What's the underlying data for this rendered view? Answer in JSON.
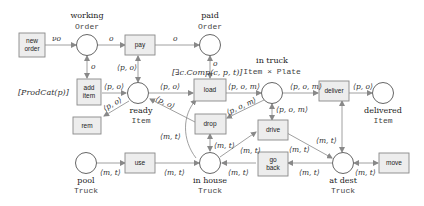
{
  "diagram": {
    "type": "colored-petri-net",
    "places": [
      {
        "id": "working",
        "name": "working",
        "type": "Order"
      },
      {
        "id": "paid",
        "name": "paid",
        "type": "Order"
      },
      {
        "id": "ready",
        "name": "ready",
        "type": "Item"
      },
      {
        "id": "intruck",
        "name": "in truck",
        "type": "Item × Plate"
      },
      {
        "id": "delivered",
        "name": "delivered",
        "type": "Item"
      },
      {
        "id": "pool",
        "name": "pool",
        "type": "Truck"
      },
      {
        "id": "inhouse",
        "name": "in house",
        "type": "Truck"
      },
      {
        "id": "atdest",
        "name": "at dest",
        "type": "Truck"
      }
    ],
    "transitions": [
      {
        "id": "neworder",
        "label_line1": "new",
        "label_line2": "order"
      },
      {
        "id": "pay",
        "label": "pay"
      },
      {
        "id": "additem",
        "label_line1": "add",
        "label_line2": "item"
      },
      {
        "id": "rem",
        "label": "rem"
      },
      {
        "id": "load",
        "label": "load"
      },
      {
        "id": "drop",
        "label": "drop"
      },
      {
        "id": "deliver",
        "label": "deliver"
      },
      {
        "id": "drive",
        "label": "drive"
      },
      {
        "id": "goback",
        "label_line1": "go",
        "label_line2": "back"
      },
      {
        "id": "use",
        "label": "use"
      },
      {
        "id": "move",
        "label": "move"
      }
    ],
    "guards": {
      "additem": "[ProdCat(p)]",
      "load": "[∃c.Comp(c, p, t)]"
    },
    "arc_labels": {
      "neworder_working": "νo",
      "working_pay": "o",
      "pay_paid": "o",
      "working_additem": "o",
      "paid_load": "o",
      "additem_ready": "⟨p, o⟩",
      "ready_pay": "⟨p, o⟩",
      "ready_load": "⟨p, o⟩",
      "ready_rem": "⟨p, o⟩",
      "drop_ready": "⟨p, o⟩",
      "load_intruck": "⟨p, o, m⟩",
      "intruck_deliver": "⟨p, o, m⟩",
      "deliver_delivered": "⟨p, o⟩",
      "intruck_drop": "⟨p, o, m⟩",
      "intruck_drive": "⟨p, o, m⟩",
      "inhouse_load": "⟨m, t⟩",
      "drop_inhouse": "⟨m, t⟩",
      "inhouse_drive": "⟨m, t⟩",
      "drive_atdest": "⟨m, t⟩",
      "atdest_goback": "⟨m, t⟩",
      "goback_inhouse": "⟨m, t⟩",
      "pool_use": "⟨m, t⟩",
      "use_inhouse": "⟨m, t⟩",
      "deliver_atdest": "⟨m, t⟩",
      "atdest_move": "⟨m, t⟩"
    }
  }
}
